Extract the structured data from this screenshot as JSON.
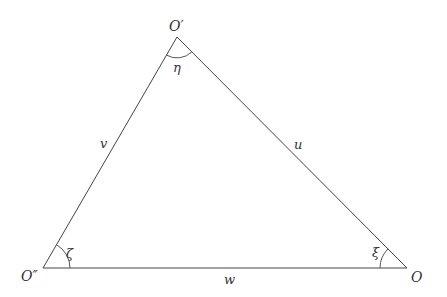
{
  "diagram": {
    "type": "triangle",
    "vertices": [
      {
        "id": "top",
        "label": "O′",
        "x": 177,
        "y": 37
      },
      {
        "id": "bottom_left",
        "label": "O″",
        "x": 43,
        "y": 268
      },
      {
        "id": "bottom_right",
        "label": "O",
        "x": 407,
        "y": 268
      }
    ],
    "sides": [
      {
        "id": "left",
        "label": "v",
        "from": "bottom_left",
        "to": "top"
      },
      {
        "id": "right",
        "label": "u",
        "from": "top",
        "to": "bottom_right"
      },
      {
        "id": "bottom",
        "label": "w",
        "from": "bottom_left",
        "to": "bottom_right"
      }
    ],
    "angles": [
      {
        "vertex": "top",
        "label": "η"
      },
      {
        "vertex": "bottom_left",
        "label": "ζ"
      },
      {
        "vertex": "bottom_right",
        "label": "ξ"
      }
    ]
  },
  "labels": {
    "vertex_top": "O′",
    "vertex_bottom_left": "O″",
    "vertex_bottom_right": "O",
    "side_left": "v",
    "side_right": "u",
    "side_bottom": "w",
    "angle_top": "η",
    "angle_bottom_left": "ζ",
    "angle_bottom_right": "ξ"
  },
  "colors": {
    "stroke": "#444444",
    "text": "#333333",
    "background": "#ffffff"
  }
}
